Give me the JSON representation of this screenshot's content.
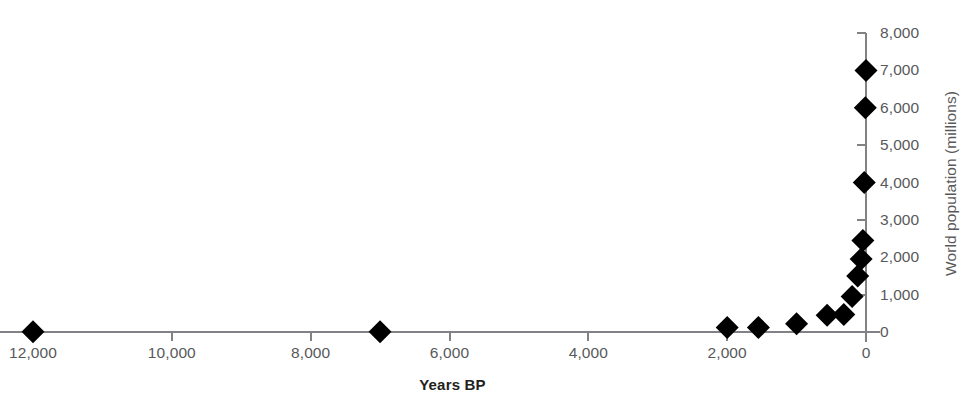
{
  "chart_data": {
    "type": "scatter",
    "title": "",
    "xlabel": "Years BP",
    "ylabel": "World population (millions)",
    "x_axis_reversed": true,
    "xlim": [
      12000,
      0
    ],
    "ylim": [
      0,
      8000
    ],
    "grid": false,
    "legend": false,
    "marker": "diamond",
    "marker_color": "#000000",
    "axis_color": "#808285",
    "text_color": "#58595b",
    "xticks": [
      {
        "value": 12000,
        "label": "12,000"
      },
      {
        "value": 10000,
        "label": "10,000"
      },
      {
        "value": 8000,
        "label": "8,000"
      },
      {
        "value": 6000,
        "label": "6,000"
      },
      {
        "value": 4000,
        "label": "4,000"
      },
      {
        "value": 2000,
        "label": "2,000"
      },
      {
        "value": 0,
        "label": "0"
      }
    ],
    "yticks": [
      {
        "value": 0,
        "label": "0"
      },
      {
        "value": 1000,
        "label": "1,000"
      },
      {
        "value": 2000,
        "label": "2,000"
      },
      {
        "value": 3000,
        "label": "3,000"
      },
      {
        "value": 4000,
        "label": "4,000"
      },
      {
        "value": 5000,
        "label": "5,000"
      },
      {
        "value": 6000,
        "label": "6,000"
      },
      {
        "value": 7000,
        "label": "7,000"
      },
      {
        "value": 8000,
        "label": "8,000"
      }
    ],
    "points": [
      {
        "x": 12000,
        "y": 5
      },
      {
        "x": 7000,
        "y": 5
      },
      {
        "x": 2000,
        "y": 120
      },
      {
        "x": 1550,
        "y": 120
      },
      {
        "x": 1000,
        "y": 220
      },
      {
        "x": 560,
        "y": 450
      },
      {
        "x": 320,
        "y": 470
      },
      {
        "x": 200,
        "y": 950
      },
      {
        "x": 120,
        "y": 1500
      },
      {
        "x": 70,
        "y": 1950
      },
      {
        "x": 45,
        "y": 2450
      },
      {
        "x": 25,
        "y": 4000
      },
      {
        "x": 10,
        "y": 6000
      },
      {
        "x": 0,
        "y": 7000
      }
    ]
  }
}
